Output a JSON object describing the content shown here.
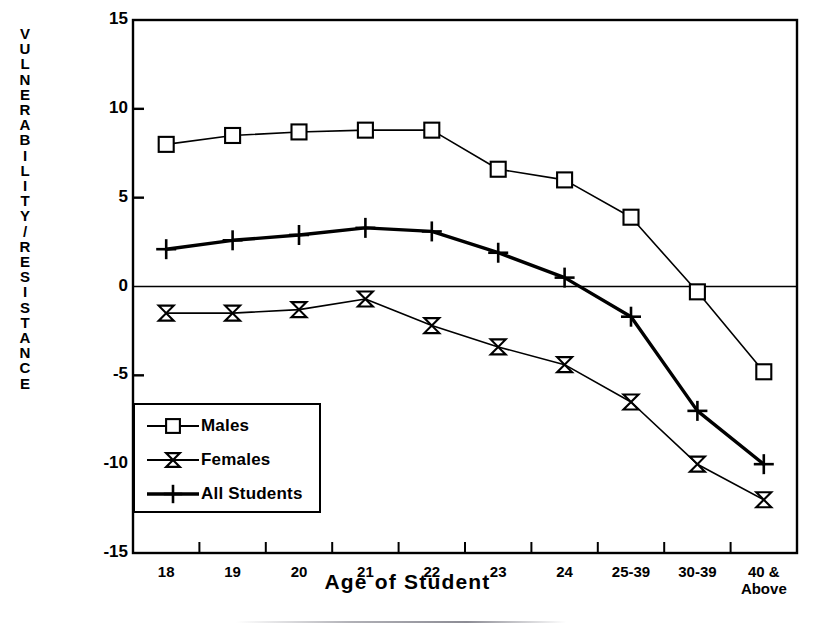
{
  "chart_data": {
    "type": "line",
    "title": "",
    "xlabel": "Age of Student",
    "ylabel": "VULNERABILITY/RESISTANCE",
    "categories": [
      "18",
      "19",
      "20",
      "21",
      "22",
      "23",
      "24",
      "25-39",
      "30-39",
      "40 &\nAbove"
    ],
    "ylim": [
      -15,
      15
    ],
    "yticks": [
      15,
      10,
      5,
      0,
      -5,
      -10,
      -15
    ],
    "ytick_labels": [
      "15",
      "10",
      "5",
      "0",
      "-5",
      "-10",
      "-15"
    ],
    "grid": false,
    "zero_line": true,
    "legend_position": "lower-left-inside",
    "series": [
      {
        "name": "Males",
        "marker": "square",
        "line_width": 1.6,
        "color": "#000000",
        "values": [
          8.0,
          8.5,
          8.7,
          8.8,
          8.8,
          6.6,
          6.0,
          3.9,
          -0.3,
          -4.8
        ]
      },
      {
        "name": "Females",
        "marker": "bowtie",
        "line_width": 1.6,
        "color": "#000000",
        "values": [
          -1.5,
          -1.5,
          -1.3,
          -0.7,
          -2.2,
          -3.4,
          -4.4,
          -6.5,
          -10.0,
          -12.0
        ]
      },
      {
        "name": "All Students",
        "marker": "plus",
        "line_width": 3.4,
        "color": "#000000",
        "values": [
          2.1,
          2.6,
          2.9,
          3.3,
          3.1,
          1.9,
          0.5,
          -1.7,
          -7.0,
          -10.0
        ]
      }
    ]
  },
  "legend": {
    "items": [
      {
        "label": "Males",
        "marker": "square"
      },
      {
        "label": "Females",
        "marker": "bowtie"
      },
      {
        "label": "All Students",
        "marker": "plus"
      }
    ]
  },
  "axes": {
    "y_title_letters": [
      "V",
      "U",
      "L",
      "N",
      "E",
      "R",
      "A",
      "B",
      "I",
      "L",
      "I",
      "T",
      "Y",
      "/",
      "R",
      "E",
      "S",
      "I",
      "S",
      "T",
      "A",
      "N",
      "C",
      "E"
    ],
    "x_title": "Age of Student"
  },
  "colors": {
    "ink": "#000000",
    "paper": "#ffffff"
  }
}
